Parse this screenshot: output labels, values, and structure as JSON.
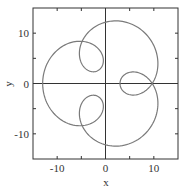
{
  "chart_data": {
    "type": "line",
    "title": "",
    "xlabel": "x",
    "ylabel": "y",
    "xlim": [
      -15,
      15
    ],
    "ylim": [
      -15,
      15
    ],
    "grid": false,
    "legend": null,
    "x_ticks": [
      -10,
      0,
      10
    ],
    "y_ticks": [
      -10,
      0,
      10
    ],
    "x_tick_labels": [
      "-10",
      "0",
      "10"
    ],
    "y_tick_labels": [
      "-10",
      "0",
      "10"
    ],
    "minor_x_ticks": [
      -5,
      5
    ],
    "minor_y_ticks": [
      -5,
      5
    ],
    "zero_lines": true,
    "series": [
      {
        "name": "parametric curve",
        "description": "3-loop epitrochoid: x = 8cos(t) - 5cos(4t), y = 8sin(t) - 5sin(4t)",
        "x": [
          3.0,
          4.19,
          6.83,
          9.36,
          10.6,
          10.7,
          10.19,
          9.62,
          8.96,
          7.6,
          5.23,
          2.01,
          -1.35,
          -4.13,
          -5.87,
          -6.49,
          -6.33,
          -5.96,
          -5.53,
          -4.82,
          -3.83,
          -2.88,
          -2.39,
          -2.6,
          -3.5,
          -4.84,
          -6.41,
          -8.05,
          -9.76,
          -11.28,
          -12.41,
          -13.0,
          -12.41,
          -11.28,
          -9.76,
          -8.05,
          -6.41,
          -4.84,
          -3.5,
          -2.6,
          -2.39,
          -2.88,
          -3.83,
          -4.82,
          -5.53,
          -5.96,
          -6.33,
          -6.49,
          -5.87,
          -4.13,
          -1.35,
          2.01,
          5.23,
          7.6,
          8.96,
          9.62,
          10.19,
          10.7,
          10.6,
          9.36,
          6.83,
          4.19,
          3.0
        ],
        "y": [
          0.0,
          -2.18,
          -2.3,
          -0.48,
          2.42,
          5.36,
          7.77,
          9.65,
          11.06,
          12.1,
          12.69,
          12.66,
          11.96,
          10.53,
          8.49,
          6.37,
          4.61,
          3.44,
          2.79,
          2.52,
          2.86,
          4.01,
          5.71,
          7.37,
          8.4,
          8.48,
          7.72,
          6.34,
          4.6,
          2.76,
          1.04,
          0.0,
          -1.04,
          -2.76,
          -4.6,
          -6.34,
          -7.72,
          -8.48,
          -8.4,
          -7.37,
          -5.71,
          -4.01,
          -2.86,
          -2.52,
          -2.79,
          -3.44,
          -4.61,
          -6.37,
          -8.49,
          -10.53,
          -11.96,
          -12.66,
          -12.69,
          -12.1,
          -11.06,
          -9.65,
          -7.77,
          -5.36,
          -2.42,
          0.48,
          2.3,
          2.18,
          0.0
        ],
        "color": "#7a7a7a",
        "param": {
          "a": 8,
          "b": 5,
          "k": 4,
          "samples": 400
        }
      }
    ]
  },
  "style": {
    "frame_color": "#333333",
    "zero_line_color": "#333333",
    "curve_color": "#7a7a7a"
  },
  "plot_box": {
    "left": 33,
    "top": 8,
    "right": 178,
    "bottom": 159
  }
}
